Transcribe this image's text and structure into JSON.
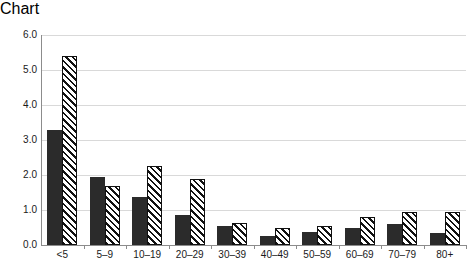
{
  "chart_data": {
    "type": "bar",
    "title": "",
    "subtitle": "",
    "xlabel": "",
    "ylabel": "",
    "ylim": [
      0.0,
      6.0
    ],
    "ytick_labels": [
      "0.0",
      "1.0",
      "2.0",
      "3.0",
      "4.0",
      "5.0",
      "6.0"
    ],
    "ytick_values": [
      0.0,
      1.0,
      2.0,
      3.0,
      4.0,
      5.0,
      6.0
    ],
    "grid": "horizontal",
    "legend": "none",
    "categories": [
      "<5",
      "5–9",
      "10–19",
      "20–29",
      "30–39",
      "40–49",
      "50–59",
      "60–69",
      "70–79",
      "80+"
    ],
    "series": [
      {
        "name": "solid-black-series",
        "fill": "solid",
        "color": "#2b2b2b",
        "values": [
          3.3,
          1.95,
          1.38,
          0.85,
          0.55,
          0.25,
          0.38,
          0.48,
          0.6,
          0.35
        ]
      },
      {
        "name": "hatched-series",
        "fill": "diagonal-hatch",
        "color": "#111111",
        "values": [
          5.4,
          1.68,
          2.25,
          1.9,
          0.62,
          0.5,
          0.55,
          0.8,
          0.95,
          0.95
        ]
      }
    ],
    "axis_color": "#8c8c8c",
    "gridline_color": "#d9d9d9"
  }
}
